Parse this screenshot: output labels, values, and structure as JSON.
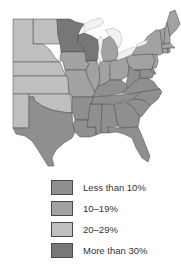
{
  "colors": {
    "less_than_10": "#8f8f8f",
    "10_19": "#a2a2a2",
    "20_29": "#bfbfbf",
    "more_than_30": "#777777",
    "border": "#4a4a4a",
    "lake": "#f2f2f2"
  },
  "legend": {
    "items": [
      {
        "label": "Less than 10%",
        "category": "less_than_10"
      },
      {
        "label": "10–19%",
        "category": "10_19"
      },
      {
        "label": "20–29%",
        "category": "20_29"
      },
      {
        "label": "More than 30%",
        "category": "more_than_30"
      }
    ]
  },
  "map": {
    "region": "Eastern and Central United States",
    "states": {
      "ND": "20_29",
      "SD": "20_29",
      "NE": "20_29",
      "KS": "20_29",
      "OK": "20_29",
      "NM": "20_29",
      "MN": "more_than_30",
      "WI": "more_than_30",
      "IA": "10_19",
      "MO": "10_19",
      "IL": "10_19",
      "IN": "10_19",
      "OH": "10_19",
      "MI": "10_19",
      "PA": "10_19",
      "NY": "10_19",
      "NJ": "10_19",
      "CT": "10_19",
      "RI": "10_19",
      "MA": "10_19",
      "VT": "10_19",
      "NH": "10_19",
      "ME": "10_19",
      "TX": "less_than_10",
      "AR": "less_than_10",
      "LA": "less_than_10",
      "MS": "less_than_10",
      "AL": "less_than_10",
      "GA": "less_than_10",
      "FL": "less_than_10",
      "SC": "less_than_10",
      "NC": "less_than_10",
      "TN": "less_than_10",
      "KY": "less_than_10",
      "VA": "less_than_10",
      "WV": "less_than_10",
      "MD": "less_than_10",
      "DE": "less_than_10"
    }
  }
}
